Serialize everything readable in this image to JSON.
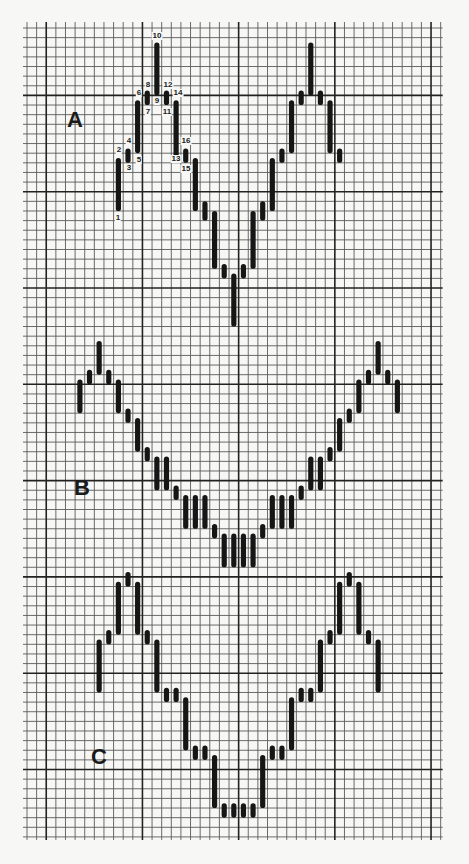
{
  "chart_data": {
    "type": "bar",
    "subtype": "swing-chart-on-graph-paper",
    "title": "",
    "xlabel": "",
    "ylabel": "",
    "grid": {
      "on": true,
      "x0": 27,
      "y0": 28,
      "cell_w": 9.62,
      "cell_h": 9.63,
      "cols": 43,
      "rows": 84,
      "major_every": 10,
      "major_col_offset": 2,
      "major_row_offset": 7,
      "minor_color": "#5a5a5a",
      "major_color": "#222222",
      "bar_color": "#161616"
    },
    "panels": [
      {
        "name": "A",
        "label": "A",
        "label_pos": {
          "x": 67,
          "y": 109
        },
        "bars": [
          {
            "col": 9,
            "top": 13.5,
            "bottom": 19
          },
          {
            "col": 10,
            "top": 12.5,
            "bottom": 14
          },
          {
            "col": 11,
            "top": 7.5,
            "bottom": 13
          },
          {
            "col": 12,
            "top": 6.5,
            "bottom": 8
          },
          {
            "col": 13,
            "top": 1.5,
            "bottom": 7
          },
          {
            "col": 14,
            "top": 6.5,
            "bottom": 8
          },
          {
            "col": 15,
            "top": 7.5,
            "bottom": 13.5
          },
          {
            "col": 16,
            "top": 12.5,
            "bottom": 14
          },
          {
            "col": 17,
            "top": 13.5,
            "bottom": 19
          },
          {
            "col": 18,
            "top": 18,
            "bottom": 20
          },
          {
            "col": 19,
            "top": 19,
            "bottom": 25
          },
          {
            "col": 20,
            "top": 24.5,
            "bottom": 26
          },
          {
            "col": 21,
            "top": 25.5,
            "bottom": 31
          },
          {
            "col": 22,
            "top": 24.5,
            "bottom": 26
          },
          {
            "col": 23,
            "top": 19,
            "bottom": 25
          },
          {
            "col": 24,
            "top": 18,
            "bottom": 20
          },
          {
            "col": 25,
            "top": 13.5,
            "bottom": 19
          },
          {
            "col": 26,
            "top": 12.5,
            "bottom": 14
          },
          {
            "col": 27,
            "top": 7.5,
            "bottom": 13
          },
          {
            "col": 28,
            "top": 6.5,
            "bottom": 8
          },
          {
            "col": 29,
            "top": 1.5,
            "bottom": 7
          },
          {
            "col": 30,
            "top": 6.5,
            "bottom": 8
          },
          {
            "col": 31,
            "top": 7.5,
            "bottom": 13
          },
          {
            "col": 32,
            "top": 12.5,
            "bottom": 14
          }
        ],
        "point_labels": [
          {
            "text": "1",
            "x": 118,
            "y": 218
          },
          {
            "text": "2",
            "x": 119,
            "y": 150
          },
          {
            "text": "3",
            "x": 129,
            "y": 168
          },
          {
            "text": "4",
            "x": 129,
            "y": 141
          },
          {
            "text": "5",
            "x": 139,
            "y": 160
          },
          {
            "text": "6",
            "x": 139,
            "y": 93
          },
          {
            "text": "7",
            "x": 148,
            "y": 112
          },
          {
            "text": "8",
            "x": 148,
            "y": 85
          },
          {
            "text": "9",
            "x": 157,
            "y": 101
          },
          {
            "text": "10",
            "x": 157,
            "y": 36
          },
          {
            "text": "11",
            "x": 167,
            "y": 112
          },
          {
            "text": "12",
            "x": 168,
            "y": 85
          },
          {
            "text": "13",
            "x": 176,
            "y": 159
          },
          {
            "text": "14",
            "x": 178,
            "y": 93
          },
          {
            "text": "15",
            "x": 186,
            "y": 169
          },
          {
            "text": "16",
            "x": 186,
            "y": 141
          }
        ]
      },
      {
        "name": "B",
        "label": "B",
        "label_pos": {
          "x": 74,
          "y": 477
        },
        "bars": [
          {
            "col": 5,
            "top": 36.5,
            "bottom": 40
          },
          {
            "col": 6,
            "top": 35.5,
            "bottom": 37
          },
          {
            "col": 7,
            "top": 32.5,
            "bottom": 36
          },
          {
            "col": 8,
            "top": 35.5,
            "bottom": 37
          },
          {
            "col": 9,
            "top": 36.5,
            "bottom": 40
          },
          {
            "col": 10,
            "top": 39.5,
            "bottom": 41
          },
          {
            "col": 11,
            "top": 40.5,
            "bottom": 44
          },
          {
            "col": 12,
            "top": 43.5,
            "bottom": 45
          },
          {
            "col": 13,
            "top": 44.5,
            "bottom": 48
          },
          {
            "col": 14,
            "top": 44.5,
            "bottom": 48
          },
          {
            "col": 15,
            "top": 47.5,
            "bottom": 49
          },
          {
            "col": 16,
            "top": 48.5,
            "bottom": 52
          },
          {
            "col": 17,
            "top": 48.5,
            "bottom": 52
          },
          {
            "col": 18,
            "top": 48.5,
            "bottom": 52
          },
          {
            "col": 19,
            "top": 51.5,
            "bottom": 53
          },
          {
            "col": 20,
            "top": 52.5,
            "bottom": 56
          },
          {
            "col": 21,
            "top": 52.5,
            "bottom": 56
          },
          {
            "col": 22,
            "top": 52.5,
            "bottom": 56
          },
          {
            "col": 23,
            "top": 52.5,
            "bottom": 56
          },
          {
            "col": 24,
            "top": 51.5,
            "bottom": 53
          },
          {
            "col": 25,
            "top": 48.5,
            "bottom": 52
          },
          {
            "col": 26,
            "top": 48.5,
            "bottom": 52
          },
          {
            "col": 27,
            "top": 48.5,
            "bottom": 52
          },
          {
            "col": 28,
            "top": 47.5,
            "bottom": 49
          },
          {
            "col": 29,
            "top": 44.5,
            "bottom": 48
          },
          {
            "col": 30,
            "top": 44.5,
            "bottom": 48
          },
          {
            "col": 31,
            "top": 43.5,
            "bottom": 45
          },
          {
            "col": 32,
            "top": 40.5,
            "bottom": 44
          },
          {
            "col": 33,
            "top": 39.5,
            "bottom": 41
          },
          {
            "col": 34,
            "top": 36.5,
            "bottom": 40
          },
          {
            "col": 35,
            "top": 35.5,
            "bottom": 37
          },
          {
            "col": 36,
            "top": 32.5,
            "bottom": 36
          },
          {
            "col": 37,
            "top": 35.5,
            "bottom": 37
          },
          {
            "col": 38,
            "top": 36.5,
            "bottom": 40
          }
        ],
        "point_labels": []
      },
      {
        "name": "C",
        "label": "C",
        "label_pos": {
          "x": 91,
          "y": 746
        },
        "bars": [
          {
            "col": 7,
            "top": 63.5,
            "bottom": 69
          },
          {
            "col": 8,
            "top": 62.5,
            "bottom": 64
          },
          {
            "col": 9,
            "top": 57.5,
            "bottom": 63
          },
          {
            "col": 10,
            "top": 56.5,
            "bottom": 58
          },
          {
            "col": 11,
            "top": 57.5,
            "bottom": 63
          },
          {
            "col": 12,
            "top": 62.5,
            "bottom": 64
          },
          {
            "col": 13,
            "top": 63.5,
            "bottom": 69
          },
          {
            "col": 14,
            "top": 68.5,
            "bottom": 70
          },
          {
            "col": 15,
            "top": 68.5,
            "bottom": 70
          },
          {
            "col": 16,
            "top": 69.5,
            "bottom": 75
          },
          {
            "col": 17,
            "top": 74.5,
            "bottom": 76
          },
          {
            "col": 18,
            "top": 74.5,
            "bottom": 76
          },
          {
            "col": 19,
            "top": 75.5,
            "bottom": 81
          },
          {
            "col": 20,
            "top": 80.5,
            "bottom": 82
          },
          {
            "col": 21,
            "top": 80.5,
            "bottom": 82
          },
          {
            "col": 22,
            "top": 80.5,
            "bottom": 82
          },
          {
            "col": 23,
            "top": 80.5,
            "bottom": 82
          },
          {
            "col": 24,
            "top": 75.5,
            "bottom": 81
          },
          {
            "col": 25,
            "top": 74.5,
            "bottom": 76
          },
          {
            "col": 26,
            "top": 74.5,
            "bottom": 76
          },
          {
            "col": 27,
            "top": 69.5,
            "bottom": 75
          },
          {
            "col": 28,
            "top": 68.5,
            "bottom": 70
          },
          {
            "col": 29,
            "top": 68.5,
            "bottom": 70
          },
          {
            "col": 30,
            "top": 63.5,
            "bottom": 69
          },
          {
            "col": 31,
            "top": 62.5,
            "bottom": 64
          },
          {
            "col": 32,
            "top": 57.5,
            "bottom": 63
          },
          {
            "col": 33,
            "top": 56.5,
            "bottom": 58
          },
          {
            "col": 34,
            "top": 57.5,
            "bottom": 63
          },
          {
            "col": 35,
            "top": 62.5,
            "bottom": 64
          },
          {
            "col": 36,
            "top": 63.5,
            "bottom": 69
          }
        ],
        "point_labels": []
      }
    ]
  }
}
